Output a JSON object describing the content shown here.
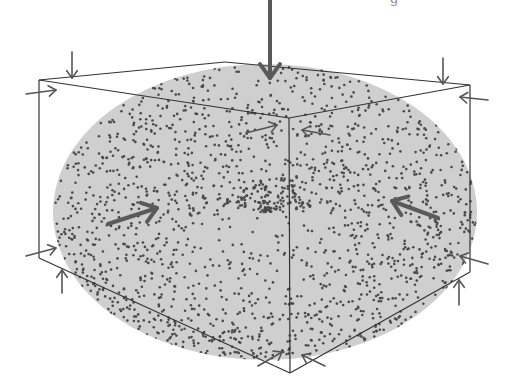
{
  "figure": {
    "title_fragment": "g",
    "colors": {
      "background": "#ffffff",
      "ellipsoid_fill": "#cfcfcf",
      "particles": "#4a4a4a",
      "box_lines": "#333333",
      "small_arrows": "#555555",
      "large_arrows": "#5a5a5a"
    },
    "ellipsoid": {
      "cx": 265,
      "cy": 212,
      "rx": 212,
      "ry": 148,
      "particle_count": 1800
    },
    "box": {
      "top_left": [
        39,
        80
      ],
      "top_back": [
        225,
        62
      ],
      "top_right": [
        470,
        85
      ],
      "top_front": [
        289,
        118
      ],
      "bottom_left": [
        39,
        258
      ],
      "bottom_right": [
        470,
        272
      ],
      "bottom_front": [
        290,
        373
      ]
    },
    "large_arrows": [
      {
        "name": "top-center-arrow",
        "from": [
          270,
          0
        ],
        "to": [
          270,
          78
        ]
      },
      {
        "name": "left-face-arrow",
        "from": [
          108,
          224
        ],
        "to": [
          157,
          208
        ]
      },
      {
        "name": "right-face-arrow",
        "from": [
          438,
          218
        ],
        "to": [
          392,
          201
        ]
      }
    ],
    "small_arrows": [
      {
        "name": "top-left-down-arrow",
        "from": [
          72,
          52
        ],
        "to": [
          72,
          78
        ]
      },
      {
        "name": "top-left-right-arrow",
        "from": [
          26,
          94
        ],
        "to": [
          56,
          90
        ]
      },
      {
        "name": "top-right-down-arrow",
        "from": [
          443,
          58
        ],
        "to": [
          443,
          84
        ]
      },
      {
        "name": "top-right-left-arrow",
        "from": [
          488,
          100
        ],
        "to": [
          460,
          97
        ]
      },
      {
        "name": "top-front-right-arrow",
        "from": [
          246,
          133
        ],
        "to": [
          277,
          125
        ]
      },
      {
        "name": "top-front-left-arrow",
        "from": [
          330,
          135
        ],
        "to": [
          302,
          130
        ]
      },
      {
        "name": "bottom-left-right-arrow",
        "from": [
          26,
          256
        ],
        "to": [
          56,
          248
        ]
      },
      {
        "name": "bottom-left-up-arrow",
        "from": [
          62,
          293
        ],
        "to": [
          62,
          270
        ]
      },
      {
        "name": "bottom-right-left-arrow",
        "from": [
          488,
          264
        ],
        "to": [
          460,
          256
        ]
      },
      {
        "name": "bottom-right-up-arrow",
        "from": [
          459,
          305
        ],
        "to": [
          459,
          280
        ]
      },
      {
        "name": "bottom-front-right-arrow",
        "from": [
          258,
          366
        ],
        "to": [
          282,
          352
        ]
      },
      {
        "name": "bottom-front-left-arrow",
        "from": [
          325,
          366
        ],
        "to": [
          302,
          355
        ]
      }
    ]
  }
}
